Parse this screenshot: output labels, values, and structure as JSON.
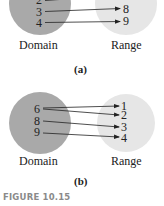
{
  "colors": {
    "domain_fill": "#a9a9a9",
    "range_fill": "#e6e6e6",
    "arrow": "#222222",
    "caption": "#8a8a8a"
  },
  "panel_a": {
    "domain_values": [
      "2",
      "3",
      "4"
    ],
    "range_values": [
      "8",
      "9"
    ],
    "domain_label": "Domain",
    "range_label": "Range",
    "sublabel": "(a)",
    "mappings": [
      [
        "2",
        "(off-frame)"
      ],
      [
        "3",
        "8"
      ],
      [
        "4",
        "9"
      ]
    ]
  },
  "panel_b": {
    "domain_values": [
      "6",
      "8",
      "9"
    ],
    "range_values": [
      "1",
      "2",
      "3",
      "4"
    ],
    "domain_label": "Domain",
    "range_label": "Range",
    "sublabel": "(b)",
    "mappings": [
      [
        "6",
        "1"
      ],
      [
        "6",
        "2"
      ],
      [
        "8",
        "3"
      ],
      [
        "9",
        "4"
      ]
    ]
  },
  "caption": "FIGURE 10.15"
}
